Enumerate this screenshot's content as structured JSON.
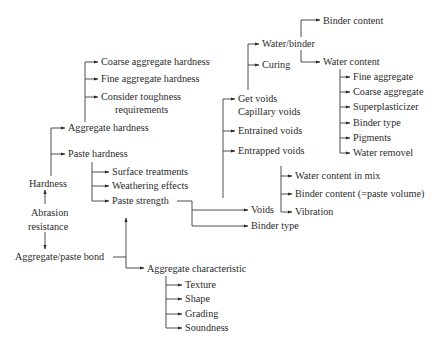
{
  "diagram": {
    "root": "Abrasion resistance",
    "nodes": {
      "binder_content": "Binder content",
      "water_binder": "Water/binder",
      "curing": "Curing",
      "water_content": "Water content",
      "wc_fine_aggregate": "Fine aggregate",
      "wc_coarse_aggregate": "Coarse aggregate",
      "wc_superplasticizer": "Superplasticizer",
      "wc_binder_type": "Binder type",
      "wc_pigments": "Pigments",
      "wc_water_removel": "Water removel",
      "get_voids": "Get voids",
      "capillary_voids": "Capillary voids",
      "entrained_voids": "Entrained voids",
      "entrapped_voids": "Entrapped voids",
      "water_content_in_mix": "Water content in mix",
      "binder_content_paste": "Binder content (=paste volume)",
      "vibration": "Vibration",
      "coarse_aggregate_hardness": "Coarse aggregate hardness",
      "fine_aggregate_hardness": "Fine aggregate hardness",
      "consider_toughness_1": "Consider toughness",
      "consider_toughness_2": "requirements",
      "aggregate_hardness": "Aggregate hardness",
      "paste_hardness": "Paste hardness",
      "surface_treatments": "Surface treatments",
      "weathering_effects": "Weathering effects",
      "paste_strength": "Paste strength",
      "voids": "Voids",
      "binder_type": "Binder type",
      "hardness": "Hardness",
      "abrasion_1": "Abrasion",
      "abrasion_2": "resistance",
      "aggregate_paste_bond": "Aggregate/paste bond",
      "aggregate_characteristic": "Aggregate characteristic",
      "texture": "Texture",
      "shape": "Shape",
      "grading": "Grading",
      "soundness": "Soundness"
    },
    "edges": [
      [
        "Abrasion resistance",
        "Hardness"
      ],
      [
        "Abrasion resistance",
        "Aggregate/paste bond"
      ],
      [
        "Hardness",
        "Aggregate hardness"
      ],
      [
        "Hardness",
        "Paste hardness"
      ],
      [
        "Aggregate hardness",
        "Coarse aggregate hardness"
      ],
      [
        "Aggregate hardness",
        "Fine aggregate hardness"
      ],
      [
        "Aggregate hardness",
        "Consider toughness requirements"
      ],
      [
        "Paste hardness",
        "Surface treatments"
      ],
      [
        "Paste hardness",
        "Weathering effects"
      ],
      [
        "Paste hardness",
        "Paste strength"
      ],
      [
        "Paste strength",
        "Voids"
      ],
      [
        "Paste strength",
        "Binder type"
      ],
      [
        "Voids",
        "Get voids / Capillary voids"
      ],
      [
        "Voids",
        "Entrained voids"
      ],
      [
        "Voids",
        "Entrapped voids"
      ],
      [
        "Get voids / Capillary voids",
        "Water/binder"
      ],
      [
        "Get voids / Capillary voids",
        "Curing"
      ],
      [
        "Water/binder",
        "Binder content"
      ],
      [
        "Water/binder",
        "Water content"
      ],
      [
        "Water content",
        "Fine aggregate"
      ],
      [
        "Water content",
        "Coarse aggregate"
      ],
      [
        "Water content",
        "Superplasticizer"
      ],
      [
        "Water content",
        "Binder type"
      ],
      [
        "Water content",
        "Pigments"
      ],
      [
        "Water content",
        "Water removel"
      ],
      [
        "Entrapped voids",
        "Water content in mix"
      ],
      [
        "Entrapped voids",
        "Binder content (=paste volume)"
      ],
      [
        "Entrapped voids",
        "Vibration"
      ],
      [
        "Aggregate/paste bond",
        "Paste strength"
      ],
      [
        "Aggregate/paste bond",
        "Aggregate characteristic"
      ],
      [
        "Aggregate characteristic",
        "Texture"
      ],
      [
        "Aggregate characteristic",
        "Shape"
      ],
      [
        "Aggregate characteristic",
        "Grading"
      ],
      [
        "Aggregate characteristic",
        "Soundness"
      ]
    ]
  }
}
